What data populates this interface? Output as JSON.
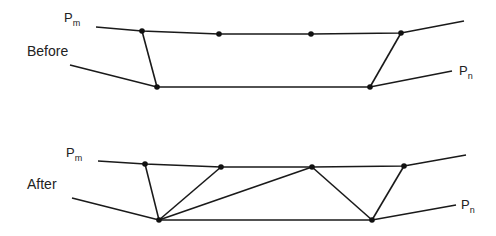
{
  "panels": [
    {
      "label": "Before",
      "label_pos": [
        27,
        44
      ],
      "pm": {
        "text": "P",
        "sub": "m",
        "pos": [
          64,
          11
        ]
      },
      "pn": {
        "text": "P",
        "sub": "n",
        "pos": [
          459,
          64
        ]
      },
      "top_line": [
        [
          96,
          27
        ],
        [
          142,
          31
        ],
        [
          219,
          34
        ],
        [
          311,
          34
        ],
        [
          401,
          33
        ],
        [
          464,
          21
        ]
      ],
      "bottom_line": [
        [
          70,
          65
        ],
        [
          157,
          87
        ],
        [
          370,
          87
        ],
        [
          452,
          71
        ]
      ],
      "edges": [
        [
          [
            142,
            31
          ],
          [
            157,
            87
          ]
        ],
        [
          [
            401,
            33
          ],
          [
            370,
            87
          ]
        ]
      ],
      "nodes": [
        [
          142,
          31
        ],
        [
          219,
          34
        ],
        [
          311,
          34
        ],
        [
          401,
          33
        ],
        [
          157,
          87
        ],
        [
          370,
          87
        ]
      ]
    },
    {
      "label": "After",
      "label_pos": [
        27,
        177
      ],
      "pm": {
        "text": "P",
        "sub": "m",
        "pos": [
          66,
          146
        ]
      },
      "pn": {
        "text": "P",
        "sub": "n",
        "pos": [
          461,
          198
        ]
      },
      "top_line": [
        [
          98,
          161
        ],
        [
          145,
          164
        ],
        [
          221,
          167
        ],
        [
          312,
          167
        ],
        [
          404,
          166
        ],
        [
          466,
          155
        ]
      ],
      "bottom_line": [
        [
          72,
          198
        ],
        [
          159,
          220
        ],
        [
          372,
          220
        ],
        [
          456,
          205
        ]
      ],
      "edges": [
        [
          [
            145,
            164
          ],
          [
            159,
            220
          ]
        ],
        [
          [
            221,
            167
          ],
          [
            159,
            220
          ]
        ],
        [
          [
            312,
            167
          ],
          [
            159,
            220
          ]
        ],
        [
          [
            312,
            167
          ],
          [
            372,
            220
          ]
        ],
        [
          [
            404,
            166
          ],
          [
            372,
            220
          ]
        ]
      ],
      "nodes": [
        [
          145,
          164
        ],
        [
          221,
          167
        ],
        [
          312,
          167
        ],
        [
          404,
          166
        ],
        [
          159,
          220
        ],
        [
          372,
          220
        ]
      ]
    }
  ],
  "colors": {
    "stroke": "#1a1a1a",
    "node": "#111111",
    "text": "#222222"
  }
}
